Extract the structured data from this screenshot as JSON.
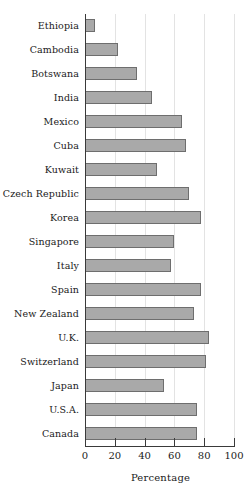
{
  "chart_data": {
    "type": "bar",
    "orientation": "horizontal",
    "title": "",
    "subtitle": "",
    "xlabel": "Percentage",
    "ylabel": "",
    "xlim": [
      0,
      100
    ],
    "xticks": [
      0,
      20,
      40,
      60,
      80,
      100
    ],
    "xtick_labels": [
      "0",
      "20",
      "40",
      "60",
      "80",
      "100"
    ],
    "grid": true,
    "grid_axis": "x",
    "legend": false,
    "legend_position": "none",
    "bar_fill_color": "#a9a9a9",
    "bar_edge_color": "#6e6e6e",
    "axis_color": "#3a3a3a",
    "gridline_color": "#e3e3e3",
    "categories": [
      "Ethiopia",
      "Cambodia",
      "Botswana",
      "India",
      "Mexico",
      "Cuba",
      "Kuwait",
      "Czech Republic",
      "Korea",
      "Singapore",
      "Italy",
      "Spain",
      "New Zealand",
      "U.K.",
      "Switzerland",
      "Japan",
      "U.S.A.",
      "Canada"
    ],
    "values": [
      7,
      22,
      35,
      45,
      65,
      68,
      48,
      70,
      78,
      60,
      58,
      78,
      73,
      83,
      81,
      53,
      75,
      75
    ]
  }
}
